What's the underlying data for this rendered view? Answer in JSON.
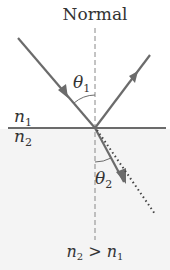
{
  "diagram": {
    "title": "Normal",
    "medium_top_label": "n",
    "medium_top_sub": "1",
    "medium_bottom_label": "n",
    "medium_bottom_sub": "2",
    "angle_incident_label": "θ",
    "angle_incident_sub": "1",
    "angle_refracted_label": "θ",
    "angle_refracted_sub": "2",
    "condition": {
      "lhs": "n",
      "lhs_sub": "2",
      "op": " > ",
      "rhs": "n",
      "rhs_sub": "1"
    },
    "colors": {
      "ray": "#6b6b6b",
      "interface": "#6b6b6b",
      "normal": "#888888",
      "lower_medium": "#f4f4f4",
      "text": "#333333"
    }
  }
}
